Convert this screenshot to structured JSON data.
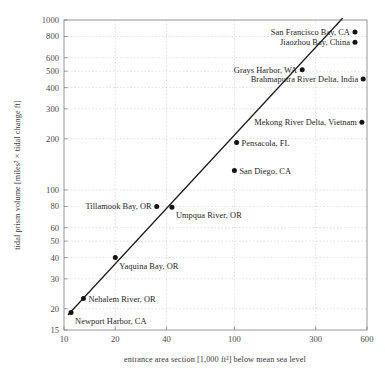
{
  "chart_data": {
    "type": "scatter",
    "title": "",
    "subtitle": "",
    "xlabel": "entrance area section [1,000 ft²] below mean sea level",
    "ylabel": "tidal prism volume [miles² × tidal change ft]",
    "xscale": "log",
    "yscale": "log",
    "xlim": [
      10,
      600
    ],
    "ylim": [
      15,
      1000
    ],
    "grid": true,
    "legend": "none",
    "xticks": [
      10,
      20,
      40,
      100,
      300,
      600
    ],
    "xticklabels": [
      "10",
      "20",
      "40",
      "100",
      "300",
      "600"
    ],
    "yticks": [
      15,
      20,
      30,
      40,
      50,
      60,
      80,
      100,
      200,
      300,
      400,
      500,
      600,
      800,
      1000
    ],
    "yticklabels": [
      "15",
      "20",
      "30",
      "40",
      "50",
      "60",
      "80",
      "100",
      "200",
      "300",
      "400",
      "500",
      "600",
      "800",
      "1000"
    ],
    "points": [
      {
        "label": "Newport Harbor, CA",
        "x": 11,
        "y": 19,
        "label_side": "below"
      },
      {
        "label": "Nehalem River, OR",
        "x": 13,
        "y": 23,
        "label_side": "right"
      },
      {
        "label": "Yaquina Bay, OR",
        "x": 20,
        "y": 40,
        "label_side": "below"
      },
      {
        "label": "Tillamook Bay, OR",
        "x": 35,
        "y": 80,
        "label_side": "left"
      },
      {
        "label": "Umpqua River, OR",
        "x": 43,
        "y": 79,
        "label_side": "below"
      },
      {
        "label": "San Diego, CA",
        "x": 100,
        "y": 130,
        "label_side": "right"
      },
      {
        "label": "Pensacola, FL",
        "x": 103,
        "y": 190,
        "label_side": "right"
      },
      {
        "label": "Mekong River Delta, Vietnam",
        "x": 560,
        "y": 250,
        "label_side": "left"
      },
      {
        "label": "Brahmaputra River Delta, India",
        "x": 570,
        "y": 450,
        "label_side": "left"
      },
      {
        "label": "Grays Harbor, WA",
        "x": 250,
        "y": 510,
        "label_side": "left"
      },
      {
        "label": "Jiaozhou Bay, China",
        "x": 510,
        "y": 740,
        "label_side": "left"
      },
      {
        "label": "San Francisco Bay, CA",
        "x": 510,
        "y": 850,
        "label_side": "left"
      }
    ],
    "trendline": {
      "description": "fitted power-law trend line",
      "x_start": 10.6,
      "y_start": 18.5,
      "x_end": 430,
      "y_end": 1020
    },
    "colors": {
      "marker": "#141414",
      "trendline": "#1c1c1c",
      "grid": "#cfcfcf",
      "frame": "#8d8d8d",
      "text": "#262626",
      "background": "#ffffff"
    }
  }
}
